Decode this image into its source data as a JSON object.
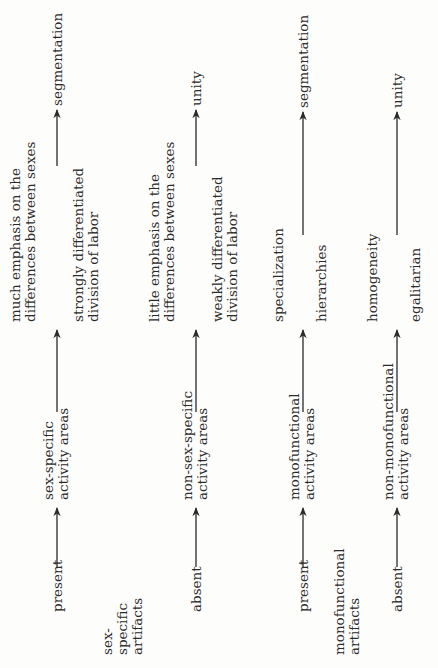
{
  "diagram": {
    "orientation": "rotated-90-ccw",
    "groups": [
      {
        "factor": [
          "sex-",
          "specific",
          "artifacts"
        ],
        "rows": [
          {
            "condition": "present",
            "activity": [
              "sex-specific",
              "activity areas"
            ],
            "upper": [
              "much emphasis on the",
              "differences between sexes"
            ],
            "lower": [
              "strongly differentiated",
              "division of labor"
            ],
            "outcome": "segmentation"
          },
          {
            "condition": "absent",
            "activity": [
              "non-sex-specific",
              "activity areas"
            ],
            "upper": [
              "little emphasis on the",
              "differences between sexes"
            ],
            "lower": [
              "weakly differentiated",
              "division of labor"
            ],
            "outcome": "unity"
          }
        ]
      },
      {
        "factor": [
          "monofunctional",
          "artifacts"
        ],
        "rows": [
          {
            "condition": "present",
            "activity": [
              "monofunctional",
              "activity areas"
            ],
            "upper": [
              "specialization"
            ],
            "lower": [
              "hierarchies"
            ],
            "outcome": "segmentation"
          },
          {
            "condition": "absent",
            "activity": [
              "non-monofunctional",
              "activity areas"
            ],
            "upper": [
              "homogeneity"
            ],
            "lower": [
              "egalitarian"
            ],
            "outcome": "unity"
          }
        ]
      }
    ]
  }
}
